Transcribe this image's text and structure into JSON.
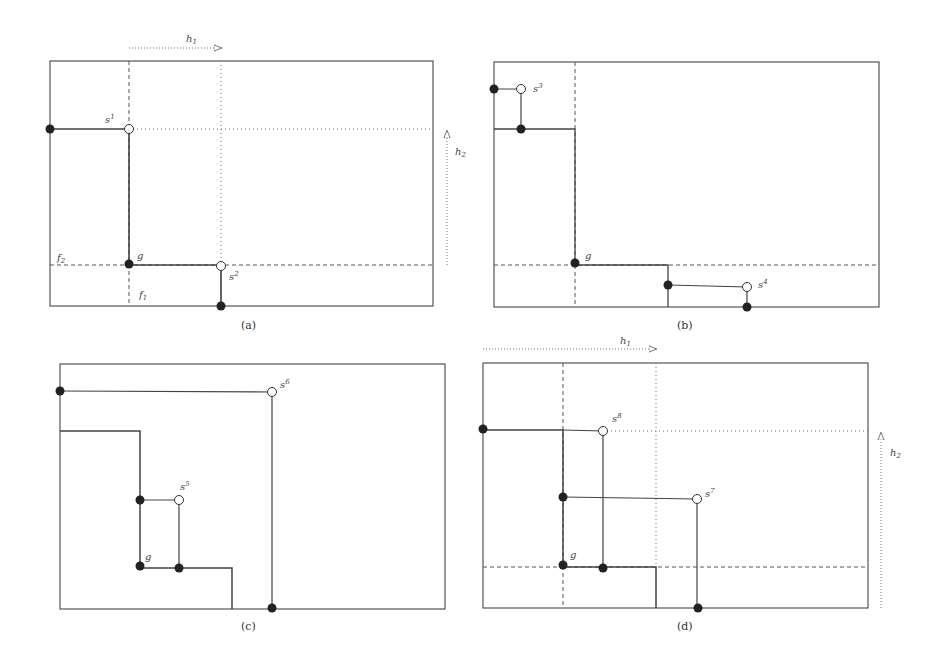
{
  "figure": {
    "panels": [
      {
        "id": "a",
        "caption": "(a)",
        "labels": {
          "s1": "s",
          "s1_sup": "1",
          "s2": "s",
          "s2_sup": "2",
          "g": "g",
          "f1": "f",
          "f1_sub": "1",
          "f2": "f",
          "f2_sub": "2",
          "h1": "h",
          "h1_sub": "1",
          "h2": "h",
          "h2_sub": "2"
        }
      },
      {
        "id": "b",
        "caption": "(b)",
        "labels": {
          "s3": "s",
          "s3_sup": "3",
          "s4": "s",
          "s4_sup": "4",
          "g": "g"
        }
      },
      {
        "id": "c",
        "caption": "(c)",
        "labels": {
          "s5": "s",
          "s5_sup": "5",
          "s6": "s",
          "s6_sup": "6",
          "g": "g"
        }
      },
      {
        "id": "d",
        "caption": "(d)",
        "labels": {
          "s7": "s",
          "s7_sup": "7",
          "s8": "s",
          "s8_sup": "8",
          "g": "g",
          "h1": "h",
          "h1_sub": "1",
          "h2": "h",
          "h2_sub": "2"
        }
      }
    ],
    "colors": {
      "line": "#4a4a4a",
      "dot": "#222222",
      "background": "#ffffff"
    }
  }
}
